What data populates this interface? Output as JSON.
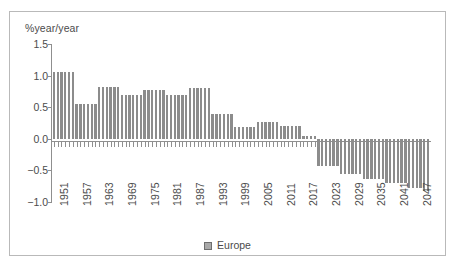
{
  "figure": {
    "border_color": "#b9b9b9",
    "background": "#ffffff"
  },
  "chart_data": {
    "type": "bar",
    "title": "",
    "subtitle": "",
    "xlabel": "",
    "ylabel": "%year/year",
    "ylim": [
      -1.0,
      1.5
    ],
    "xlim": [
      1951,
      2050
    ],
    "grid": false,
    "legend_position": "bottom",
    "bar_color": "#8c8c8c",
    "axis_color": "#8f8f8f",
    "text_color": "#4b4b4b",
    "ytick_labels": [
      "1.5",
      "1.0",
      "0.5",
      "0.0",
      "-0.5",
      "-1.0"
    ],
    "ytick_values": [
      1.5,
      1.0,
      0.5,
      0.0,
      -0.5,
      -1.0
    ],
    "xtick_labels": [
      "1951",
      "1957",
      "1963",
      "1969",
      "1975",
      "1981",
      "1987",
      "1993",
      "1999",
      "2005",
      "2011",
      "2017",
      "2023",
      "2029",
      "2035",
      "2041",
      "2047"
    ],
    "xtick_values": [
      1951,
      1957,
      1963,
      1969,
      1975,
      1981,
      1987,
      1993,
      1999,
      2005,
      2011,
      2017,
      2023,
      2029,
      2035,
      2041,
      2047
    ],
    "series": [
      {
        "name": "Europe",
        "categories": [
          1951,
          1952,
          1953,
          1954,
          1955,
          1956,
          1957,
          1958,
          1959,
          1960,
          1961,
          1962,
          1963,
          1964,
          1965,
          1966,
          1967,
          1968,
          1969,
          1970,
          1971,
          1972,
          1973,
          1974,
          1975,
          1976,
          1977,
          1978,
          1979,
          1980,
          1981,
          1982,
          1983,
          1984,
          1985,
          1986,
          1987,
          1988,
          1989,
          1990,
          1991,
          1992,
          1993,
          1994,
          1995,
          1996,
          1997,
          1998,
          1999,
          2000,
          2001,
          2002,
          2003,
          2004,
          2005,
          2006,
          2007,
          2008,
          2009,
          2010,
          2011,
          2012,
          2013,
          2014,
          2015,
          2016,
          2017,
          2018,
          2019,
          2020,
          2021,
          2022,
          2023,
          2024,
          2025,
          2026,
          2027,
          2028,
          2029,
          2030,
          2031,
          2032,
          2033,
          2034,
          2035,
          2036,
          2037,
          2038,
          2039,
          2040,
          2041,
          2042,
          2043,
          2044,
          2045,
          2046,
          2047,
          2048,
          2049,
          2050
        ],
        "values": [
          1.05,
          1.05,
          1.05,
          1.05,
          1.05,
          1.05,
          0.55,
          0.55,
          0.55,
          0.55,
          0.55,
          0.55,
          0.82,
          0.82,
          0.82,
          0.82,
          0.82,
          0.82,
          0.7,
          0.7,
          0.7,
          0.7,
          0.7,
          0.7,
          0.78,
          0.78,
          0.78,
          0.78,
          0.78,
          0.78,
          0.7,
          0.7,
          0.7,
          0.7,
          0.7,
          0.7,
          0.8,
          0.8,
          0.8,
          0.8,
          0.8,
          0.8,
          0.4,
          0.4,
          0.4,
          0.4,
          0.4,
          0.4,
          0.19,
          0.19,
          0.19,
          0.19,
          0.19,
          0.19,
          0.27,
          0.27,
          0.27,
          0.27,
          0.27,
          0.27,
          0.2,
          0.2,
          0.2,
          0.2,
          0.2,
          0.2,
          0.05,
          0.05,
          0.05,
          0.05,
          -0.43,
          -0.43,
          -0.43,
          -0.43,
          -0.43,
          -0.43,
          -0.55,
          -0.55,
          -0.55,
          -0.55,
          -0.55,
          -0.55,
          -0.64,
          -0.64,
          -0.64,
          -0.64,
          -0.64,
          -0.64,
          -0.7,
          -0.7,
          -0.7,
          -0.7,
          -0.7,
          -0.7,
          -0.78,
          -0.78,
          -0.78,
          -0.78,
          -0.82,
          -0.82
        ]
      }
    ],
    "legend": [
      {
        "label": "Europe",
        "color": "#a9a9a9"
      }
    ]
  }
}
